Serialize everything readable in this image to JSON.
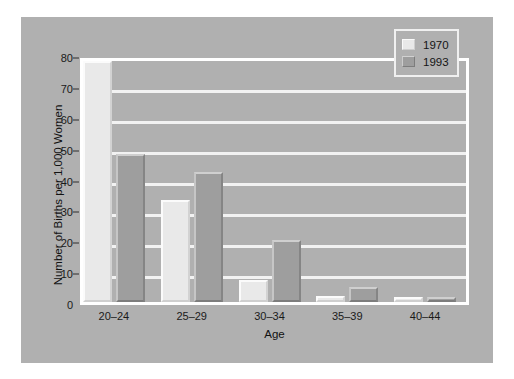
{
  "chart_data": {
    "type": "bar",
    "title": "",
    "subtitle": "",
    "xlabel": "Age",
    "ylabel": "Number of Births per 1,000 Women",
    "categories": [
      "20–24",
      "25–29",
      "30–34",
      "35–39",
      "40–44"
    ],
    "series": [
      {
        "name": "1970",
        "color": "#e9e9e9",
        "values": [
          78,
          33,
          7,
          2,
          1
        ]
      },
      {
        "name": "1993",
        "color": "#9e9e9e",
        "values": [
          48,
          42,
          20,
          5,
          1
        ]
      }
    ],
    "ylim": [
      0,
      80
    ],
    "yticks": [
      0,
      10,
      20,
      30,
      40,
      50,
      60,
      70,
      80
    ],
    "ytick_labels": [
      "0",
      "10",
      "20",
      "30",
      "40",
      "50",
      "60",
      "70",
      "80"
    ],
    "grid": true,
    "grid_axis": "y",
    "legend_position": "top-right",
    "background_color": "#b0b0b0",
    "frame_color": "#ffffff",
    "gridline_color": "#f2f2f2"
  },
  "legend": {
    "entries": [
      {
        "label": "1970",
        "swatch": "legend-swatch-1970"
      },
      {
        "label": "1993",
        "swatch": "legend-swatch-1993"
      }
    ]
  }
}
